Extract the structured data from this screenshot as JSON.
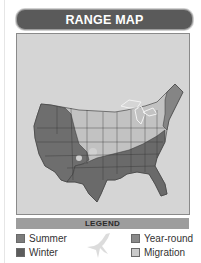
{
  "header": {
    "title": "RANGE MAP"
  },
  "map": {
    "region": "contiguous-united-states",
    "background_color": "#d5d5d5",
    "range_colors": {
      "summer": "#8a8a8a",
      "winter": "#6a6a6a",
      "year_round": "#7a7a7a",
      "migration": "#bdbdbd"
    }
  },
  "legend": {
    "title": "LEGEND",
    "items": [
      {
        "label": "Summer",
        "color": "#7c7c7c"
      },
      {
        "label": "Winter",
        "color": "#5c5c5c"
      },
      {
        "label": "Year-round",
        "color": "#8a8a8a"
      },
      {
        "label": "Migration",
        "color": "#cacaca"
      }
    ],
    "icon": "bird-silhouette-icon"
  }
}
